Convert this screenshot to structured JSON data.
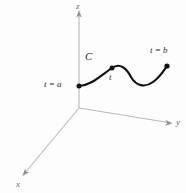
{
  "figure": {
    "type": "math-diagram-3d-space-curve",
    "background_color": "#fdfdfd",
    "axes": {
      "color": "#b9b9b9",
      "origin": [
        79,
        108
      ],
      "z": {
        "label": "z",
        "from": [
          79,
          108
        ],
        "to": [
          79,
          14
        ],
        "arrow": true
      },
      "y": {
        "label": "y",
        "from": [
          79,
          108
        ],
        "to": [
          171,
          123
        ],
        "arrow": true
      },
      "x": {
        "label": "x",
        "from": [
          79,
          108
        ],
        "to": [
          23,
          175
        ],
        "arrow": true
      }
    },
    "curve": {
      "name": "C",
      "label": "C",
      "color": "#101010",
      "stroke_width": 2.1,
      "path": "M 79 86 C 92 85, 100 76, 112 68 C 120 62, 127 69, 131 77 C 136 86, 145 88, 153 82 C 161 76, 164 70, 167 66",
      "start_point": {
        "label": "t = a",
        "position": [
          79,
          86
        ]
      },
      "mid_point": {
        "label": "t",
        "position": [
          112,
          68
        ]
      },
      "end_point": {
        "label": "t = b",
        "position": [
          167,
          66
        ]
      },
      "point_color": "#101010",
      "point_radius": 2.4
    }
  }
}
